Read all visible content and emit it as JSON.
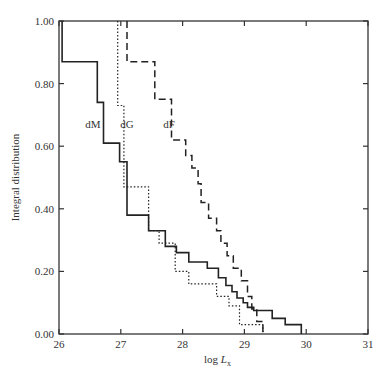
{
  "chart_data": {
    "type": "line",
    "subtype": "step",
    "title": "",
    "xlabel": "log L_x",
    "ylabel": "Integral distribution",
    "xlim": [
      26,
      31
    ],
    "ylim": [
      0,
      1.0
    ],
    "x_ticks": [
      "26",
      "27",
      "28",
      "29",
      "30",
      "31"
    ],
    "y_ticks": [
      "0.00",
      "0.20",
      "0.40",
      "0.60",
      "0.80",
      "1.00"
    ],
    "grid": false,
    "legend": "inline labels",
    "series": [
      {
        "name": "dM",
        "style": "solid",
        "label_pos": [
          26.55,
          0.67
        ],
        "points": [
          [
            26.05,
            1.0
          ],
          [
            26.05,
            0.87
          ],
          [
            26.62,
            0.87
          ],
          [
            26.62,
            0.74
          ],
          [
            26.72,
            0.74
          ],
          [
            26.72,
            0.61
          ],
          [
            26.98,
            0.61
          ],
          [
            26.98,
            0.55
          ],
          [
            27.1,
            0.55
          ],
          [
            27.1,
            0.38
          ],
          [
            27.45,
            0.38
          ],
          [
            27.45,
            0.33
          ],
          [
            27.72,
            0.33
          ],
          [
            27.72,
            0.28
          ],
          [
            27.9,
            0.28
          ],
          [
            27.9,
            0.26
          ],
          [
            28.1,
            0.26
          ],
          [
            28.1,
            0.23
          ],
          [
            28.4,
            0.23
          ],
          [
            28.4,
            0.21
          ],
          [
            28.58,
            0.21
          ],
          [
            28.58,
            0.18
          ],
          [
            28.7,
            0.18
          ],
          [
            28.7,
            0.155
          ],
          [
            28.8,
            0.155
          ],
          [
            28.8,
            0.135
          ],
          [
            28.88,
            0.135
          ],
          [
            28.88,
            0.115
          ],
          [
            28.98,
            0.115
          ],
          [
            28.98,
            0.1
          ],
          [
            29.05,
            0.1
          ],
          [
            29.05,
            0.085
          ],
          [
            29.15,
            0.085
          ],
          [
            29.15,
            0.075
          ],
          [
            29.45,
            0.075
          ],
          [
            29.45,
            0.05
          ],
          [
            29.66,
            0.05
          ],
          [
            29.66,
            0.03
          ],
          [
            29.92,
            0.03
          ],
          [
            29.92,
            0.0
          ]
        ]
      },
      {
        "name": "dG",
        "style": "dotted",
        "label_pos": [
          27.1,
          0.67
        ],
        "points": [
          [
            26.95,
            1.0
          ],
          [
            26.95,
            0.73
          ],
          [
            27.05,
            0.73
          ],
          [
            27.05,
            0.47
          ],
          [
            27.45,
            0.47
          ],
          [
            27.45,
            0.33
          ],
          [
            27.62,
            0.33
          ],
          [
            27.62,
            0.29
          ],
          [
            27.88,
            0.29
          ],
          [
            27.88,
            0.2
          ],
          [
            28.1,
            0.2
          ],
          [
            28.1,
            0.16
          ],
          [
            28.55,
            0.16
          ],
          [
            28.55,
            0.12
          ],
          [
            28.75,
            0.12
          ],
          [
            28.75,
            0.09
          ],
          [
            28.92,
            0.09
          ],
          [
            28.92,
            0.03
          ],
          [
            29.3,
            0.03
          ],
          [
            29.3,
            0.0
          ]
        ]
      },
      {
        "name": "dF",
        "style": "dashed",
        "label_pos": [
          27.78,
          0.67
        ],
        "points": [
          [
            27.1,
            1.0
          ],
          [
            27.1,
            0.87
          ],
          [
            27.55,
            0.87
          ],
          [
            27.55,
            0.75
          ],
          [
            27.82,
            0.75
          ],
          [
            27.82,
            0.62
          ],
          [
            28.05,
            0.62
          ],
          [
            28.05,
            0.57
          ],
          [
            28.15,
            0.57
          ],
          [
            28.15,
            0.53
          ],
          [
            28.25,
            0.53
          ],
          [
            28.25,
            0.48
          ],
          [
            28.3,
            0.48
          ],
          [
            28.3,
            0.42
          ],
          [
            28.42,
            0.42
          ],
          [
            28.42,
            0.37
          ],
          [
            28.55,
            0.37
          ],
          [
            28.55,
            0.33
          ],
          [
            28.62,
            0.33
          ],
          [
            28.62,
            0.29
          ],
          [
            28.72,
            0.29
          ],
          [
            28.72,
            0.25
          ],
          [
            28.82,
            0.25
          ],
          [
            28.82,
            0.21
          ],
          [
            28.95,
            0.21
          ],
          [
            28.95,
            0.17
          ],
          [
            29.05,
            0.17
          ],
          [
            29.05,
            0.12
          ],
          [
            29.12,
            0.12
          ],
          [
            29.12,
            0.08
          ],
          [
            29.2,
            0.08
          ],
          [
            29.2,
            0.04
          ],
          [
            29.3,
            0.04
          ],
          [
            29.3,
            0.0
          ]
        ]
      }
    ]
  }
}
